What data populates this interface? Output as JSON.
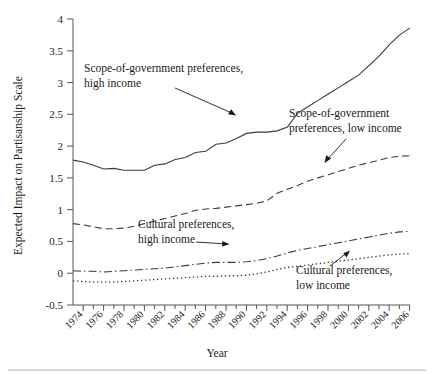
{
  "chart_data": {
    "type": "line",
    "title": "",
    "xlabel": "Year",
    "ylabel": "Expected Impact on Partisanship Scale",
    "xlim": [
      1973,
      2006
    ],
    "ylim": [
      -0.5,
      4
    ],
    "grid": false,
    "legend_position": "inline-annotations",
    "xticks": [
      "1974",
      "1976",
      "1978",
      "1980",
      "1982",
      "1984",
      "1986",
      "1988",
      "1990",
      "1992",
      "1994",
      "1996",
      "1998",
      "2000",
      "2002",
      "2004",
      "2006"
    ],
    "yticks": [
      "-0.5",
      "0",
      "0.5",
      "1",
      "1.5",
      "2",
      "2.5",
      "3",
      "3.5",
      "4"
    ],
    "x": [
      1973,
      1974,
      1975,
      1976,
      1977,
      1978,
      1979,
      1980,
      1981,
      1982,
      1983,
      1984,
      1985,
      1986,
      1987,
      1988,
      1989,
      1990,
      1991,
      1992,
      1993,
      1994,
      1995,
      1996,
      1997,
      1998,
      1999,
      2000,
      2001,
      2002,
      2003,
      2004,
      2005,
      2006
    ],
    "series": [
      {
        "name": "Scope-of-government preferences, high income",
        "style": "solid",
        "values": [
          1.78,
          1.75,
          1.7,
          1.64,
          1.65,
          1.62,
          1.62,
          1.62,
          1.7,
          1.72,
          1.79,
          1.82,
          1.9,
          1.92,
          2.03,
          2.05,
          2.12,
          2.2,
          2.22,
          2.22,
          2.24,
          2.3,
          2.52,
          2.62,
          2.72,
          2.82,
          2.92,
          3.02,
          3.12,
          3.27,
          3.42,
          3.6,
          3.75,
          3.86
        ]
      },
      {
        "name": "Scope-of-government preferences, low income",
        "style": "dashed",
        "values": [
          0.78,
          0.76,
          0.73,
          0.7,
          0.7,
          0.71,
          0.74,
          0.78,
          0.82,
          0.86,
          0.9,
          0.94,
          0.99,
          1.01,
          1.02,
          1.04,
          1.06,
          1.08,
          1.1,
          1.14,
          1.26,
          1.32,
          1.38,
          1.45,
          1.5,
          1.55,
          1.6,
          1.65,
          1.7,
          1.74,
          1.78,
          1.82,
          1.84,
          1.85
        ]
      },
      {
        "name": "Cultural preferences, high income",
        "style": "dash-dot",
        "values": [
          0.04,
          0.03,
          0.03,
          0.02,
          0.03,
          0.04,
          0.05,
          0.06,
          0.07,
          0.08,
          0.1,
          0.12,
          0.14,
          0.16,
          0.17,
          0.17,
          0.17,
          0.18,
          0.2,
          0.23,
          0.27,
          0.32,
          0.36,
          0.39,
          0.42,
          0.45,
          0.48,
          0.51,
          0.54,
          0.57,
          0.6,
          0.63,
          0.65,
          0.66
        ]
      },
      {
        "name": "Cultural preferences, low income",
        "style": "dotted",
        "values": [
          -0.12,
          -0.13,
          -0.14,
          -0.14,
          -0.14,
          -0.13,
          -0.12,
          -0.11,
          -0.1,
          -0.09,
          -0.08,
          -0.07,
          -0.06,
          -0.05,
          -0.05,
          -0.04,
          -0.04,
          -0.03,
          -0.01,
          0.02,
          0.06,
          0.09,
          0.11,
          0.13,
          0.15,
          0.17,
          0.19,
          0.21,
          0.23,
          0.25,
          0.27,
          0.29,
          0.3,
          0.31
        ]
      }
    ],
    "annotations": [
      {
        "id": "ann-sog-high",
        "line1": "Scope-of-government preferences,",
        "line2": "high income"
      },
      {
        "id": "ann-sog-low",
        "line1": "Scope-of-government",
        "line2": "preferences, low income"
      },
      {
        "id": "ann-cult-high",
        "line1": "Cultural preferences,",
        "line2": "high income"
      },
      {
        "id": "ann-cult-low",
        "line1": "Cultural preferences,",
        "line2": "low income"
      }
    ]
  }
}
